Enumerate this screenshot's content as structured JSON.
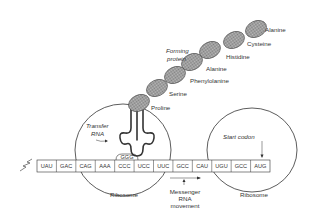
{
  "diagram": {
    "protein_label": [
      "Forming",
      "protein"
    ],
    "amino_acids": [
      "Proline",
      "Serine",
      "Phenylolanine",
      "Alanine",
      "Histidine",
      "Cysteine",
      "Alanine"
    ],
    "trna_label": [
      "Transfer",
      "RNA"
    ],
    "anticodon": "GGG",
    "codons": [
      "UAU",
      "GAC",
      "CAG",
      "AAA",
      "CCC",
      "UCC",
      "UUC",
      "GCC",
      "CAU",
      "UGU",
      "GCC",
      "AUG"
    ],
    "start_codon_label": "Start codon",
    "ribosome_left_label": "Ribosome",
    "ribosome_right_label": "Ribosome",
    "mrna_movement_label": [
      "Messenger",
      "RNA",
      "movement"
    ],
    "colors": {
      "line": "#333333",
      "bead_fill": "#9a9a9a",
      "background": "#ffffff"
    }
  }
}
